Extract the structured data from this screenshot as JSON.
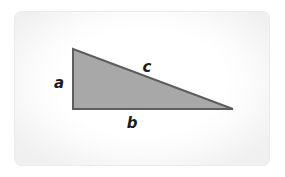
{
  "figure": {
    "name": "right-triangle-diagram",
    "card": {
      "background_color": "#ffffff",
      "border_color": "#ececec",
      "vignette_edge_color": "#f0f0f0",
      "corner_radius_px": 7
    },
    "triangle": {
      "fill_color": "#a8a8a8",
      "stroke_color": "#5e5e5e",
      "stroke_width_px": 2,
      "vertices": {
        "apex": {
          "x": 58,
          "y": 37
        },
        "bottom_left": {
          "x": 58,
          "y": 97
        },
        "bottom_right": {
          "x": 218,
          "y": 97
        }
      },
      "right_angle_vertex": "bottom_left"
    },
    "labels": [
      {
        "id": "side-a",
        "text": "a",
        "side": "vertical-leg",
        "color": "#1c1c1c",
        "x": 44,
        "y": 71
      },
      {
        "id": "side-c",
        "text": "c",
        "side": "hypotenuse",
        "color": "#1c1c1c",
        "x": 132,
        "y": 55
      },
      {
        "id": "side-b",
        "text": "b",
        "side": "horizontal-leg",
        "color": "#1c1c1c",
        "x": 117,
        "y": 111
      }
    ]
  }
}
